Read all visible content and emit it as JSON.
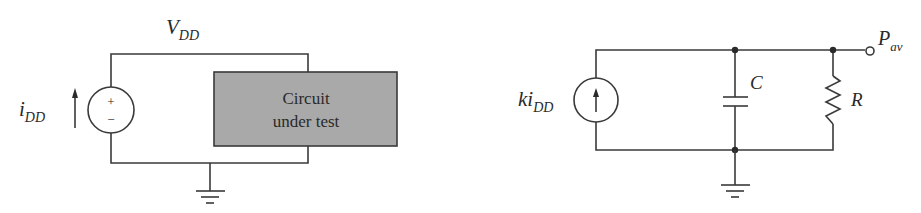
{
  "left_circuit": {
    "supply_label": {
      "main": "V",
      "sub": "DD"
    },
    "current_label": {
      "main": "i",
      "sub": "DD"
    },
    "source_signs": {
      "plus": "+",
      "minus": "−"
    },
    "box": {
      "line1": "Circuit",
      "line2": "under test",
      "fill": "#a9a9a9"
    }
  },
  "right_circuit": {
    "source_label": {
      "main": "ki",
      "sub": "DD"
    },
    "capacitor_label": "C",
    "resistor_label": "R",
    "output_label": {
      "main": "P",
      "sub": "av"
    }
  },
  "colors": {
    "wire": "#3a3a3a",
    "box_fill": "#a9a9a9",
    "background": "#ffffff"
  }
}
